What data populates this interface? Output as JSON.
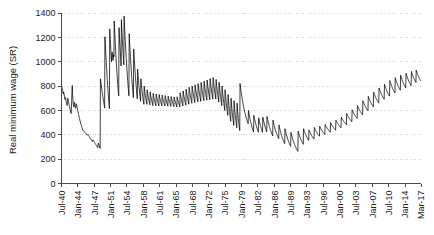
{
  "chart_data": {
    "type": "line",
    "title": "",
    "subtitle": "",
    "xlabel": "",
    "ylabel": "Real minimum wage (SR)",
    "ylim": [
      0,
      1400
    ],
    "yticks": [
      0,
      200,
      400,
      600,
      800,
      1000,
      1200,
      1400
    ],
    "ytick_labels": [
      "0",
      "200",
      "400",
      "600",
      "800",
      "1000",
      "1200",
      "1400"
    ],
    "grid": "horizontal-dotted",
    "legend": "none",
    "xtick_labels": [
      "Jul-40",
      "Jan-44",
      "Jul-47",
      "Jan-51",
      "Jul-54",
      "Jan-58",
      "Jul-61",
      "Jan-65",
      "Jul-68",
      "Jan-72",
      "Jul-75",
      "Jan-79",
      "Jul-82",
      "Jan-86",
      "Jul-89",
      "Jan-93",
      "Jul-96",
      "Jan-00",
      "Jul-03",
      "Jan-07",
      "Jul-10",
      "Jan-14",
      "Mar-17"
    ],
    "xtick_positions": [
      0,
      42,
      84,
      126,
      168,
      210,
      252,
      294,
      336,
      378,
      420,
      462,
      504,
      546,
      588,
      630,
      672,
      714,
      756,
      798,
      840,
      882,
      923
    ],
    "x_range": [
      0,
      923
    ],
    "series": [
      {
        "name": "Real minimum wage",
        "color": "#000000",
        "values": [
          800,
          795,
          783,
          770,
          762,
          745,
          735,
          752,
          742,
          728,
          712,
          700,
          690,
          706,
          697,
          682,
          668,
          655,
          648,
          640,
          672,
          700,
          690,
          676,
          665,
          652,
          640,
          630,
          618,
          607,
          596,
          586,
          575,
          612,
          680,
          760,
          805,
          742,
          690,
          660,
          640,
          628,
          646,
          668,
          655,
          640,
          628,
          618,
          635,
          655,
          648,
          636,
          624,
          612,
          600,
          590,
          578,
          566,
          556,
          545,
          535,
          524,
          514,
          505,
          496,
          487,
          478,
          470,
          462,
          454,
          446,
          438,
          440,
          437,
          433,
          430,
          427,
          424,
          420,
          417,
          414,
          411,
          408,
          405,
          402,
          399,
          396,
          400,
          404,
          400,
          396,
          392,
          388,
          384,
          380,
          376,
          372,
          368,
          364,
          360,
          356,
          352,
          348,
          344,
          352,
          358,
          354,
          350,
          346,
          342,
          338,
          334,
          330,
          326,
          322,
          318,
          314,
          310,
          306,
          302,
          298,
          294,
          320,
          332,
          324,
          316,
          308,
          300,
          292,
          288,
          860,
          840,
          820,
          800,
          782,
          764,
          748,
          730,
          714,
          698,
          682,
          666,
          650,
          634,
          620,
          1205,
          1155,
          1105,
          1055,
          1010,
          965,
          925,
          885,
          845,
          805,
          770,
          735,
          700,
          670,
          640,
          615,
          1270,
          1220,
          1170,
          1125,
          1080,
          1040,
          1000,
          1060,
          1080,
          1055,
          1030,
          1010,
          1045,
          1060,
          1040,
          1335,
          1280,
          1225,
          1175,
          1125,
          1080,
          1035,
          990,
          950,
          910,
          875,
          840,
          805,
          775,
          745,
          720,
          1280,
          1230,
          1180,
          1135,
          1090,
          1045,
          1005,
          965,
          1345,
          1290,
          1240,
          1190,
          1145,
          1100,
          1055,
          1015,
          975,
          1375,
          1320,
          1265,
          1215,
          1165,
          1120,
          1075,
          1035,
          995,
          955,
          915,
          880,
          845,
          810,
          780,
          750,
          720,
          1230,
          1180,
          1135,
          1090,
          1045,
          1005,
          965,
          925,
          890,
          855,
          820,
          790,
          760,
          730,
          705,
          1105,
          1060,
          1020,
          980,
          940,
          905,
          870,
          835,
          805,
          775,
          745,
          720,
          695,
          940,
          905,
          875,
          845,
          815,
          790,
          765,
          740,
          715,
          695,
          675,
          860,
          830,
          805,
          780,
          755,
          735,
          715,
          695,
          680,
          665,
          650,
          800,
          778,
          758,
          740,
          722,
          706,
          690,
          676,
          662,
          650,
          770,
          752,
          735,
          720,
          706,
          692,
          680,
          668,
          656,
          646,
          752,
          736,
          722,
          708,
          695,
          683,
          671,
          660,
          650,
          640,
          740,
          726,
          712,
          700,
          688,
          677,
          666,
          656,
          646,
          637,
          735,
          722,
          709,
          697,
          686,
          675,
          665,
          655,
          646,
          637,
          730,
          718,
          706,
          695,
          684,
          674,
          664,
          655,
          646,
          638,
          726,
          714,
          703,
          692,
          682,
          672,
          663,
          654,
          645,
          637,
          722,
          710,
          699,
          689,
          679,
          669,
          660,
          651,
          643,
          635,
          718,
          707,
          696,
          686,
          676,
          667,
          658,
          649,
          641,
          633,
          714,
          703,
          693,
          683,
          673,
          664,
          655,
          647,
          639,
          631,
          710,
          700,
          690,
          680,
          671,
          662,
          653,
          645,
          637,
          629,
          712,
          701,
          691,
          681,
          672,
          663,
          654,
          646,
          638,
          630,
          745,
          730,
          716,
          703,
          690,
          678,
          667,
          656,
          646,
          636,
          760,
          744,
          729,
          715,
          701,
          688,
          676,
          664,
          653,
          642,
          775,
          758,
          742,
          727,
          713,
          699,
          686,
          674,
          662,
          651,
          790,
          772,
          755,
          739,
          724,
          710,
          696,
          683,
          671,
          659,
          800,
          782,
          764,
          748,
          732,
          717,
          703,
          689,
          676,
          664,
          810,
          791,
          773,
          756,
          740,
          725,
          710,
          696,
          683,
          670,
          820,
          800,
          782,
          764,
          747,
          731,
          716,
          701,
          687,
          674,
          830,
          810,
          791,
          773,
          755,
          739,
          723,
          708,
          694,
          680,
          840,
          819,
          799,
          780,
          762,
          745,
          729,
          713,
          698,
          684,
          850,
          828,
          808,
          788,
          769,
          751,
          734,
          718,
          702,
          687,
          862,
          840,
          818,
          798,
          778,
          759,
          741,
          724,
          708,
          692,
          870,
          846,
          824,
          802,
          782,
          762,
          744,
          726,
          709,
          693,
          855,
          830,
          806,
          784,
          762,
          742,
          722,
          703,
          686,
          669,
          830,
          804,
          779,
          756,
          734,
          713,
          693,
          674,
          656,
          639,
          800,
          772,
          746,
          722,
          699,
          677,
          656,
          637,
          618,
          600,
          770,
          740,
          712,
          686,
          662,
          639,
          617,
          597,
          578,
          560,
          730,
          698,
          668,
          641,
          615,
          591,
          569,
          548,
          529,
          511,
          700,
          667,
          636,
          608,
          582,
          558,
          536,
          515,
          496,
          478,
          680,
          646,
          615,
          586,
          560,
          536,
          514,
          494,
          475,
          458,
          660,
          625,
          593,
          564,
          537,
          513,
          491,
          471,
          452,
          435,
          820,
          800,
          782,
          764,
          746,
          729,
          713,
          698,
          683,
          669,
          655,
          642,
          630,
          618,
          606,
          595,
          584,
          574,
          564,
          554,
          545,
          536,
          528,
          520,
          512,
          505,
          498,
          491,
          600,
          586,
          572,
          559,
          546,
          534,
          522,
          511,
          500,
          490,
          480,
          471,
          462,
          453,
          445,
          437,
          430,
          423,
          560,
          548,
          536,
          525,
          514,
          504,
          494,
          484,
          475,
          466,
          458,
          450,
          442,
          435,
          428,
          421,
          540,
          528,
          517,
          506,
          496,
          486,
          476,
          467,
          458,
          450,
          442,
          434,
          427,
          420,
          545,
          533,
          522,
          511,
          500,
          490,
          480,
          471,
          462,
          454,
          446,
          438,
          431,
          424,
          550,
          538,
          527,
          516,
          505,
          495,
          485,
          476,
          467,
          459,
          451,
          443,
          436,
          429,
          422,
          415,
          408,
          402,
          396,
          390,
          520,
          508,
          497,
          486,
          476,
          466,
          457,
          448,
          440,
          432,
          424,
          417,
          410,
          403,
          397,
          391,
          385,
          379,
          374,
          368,
          480,
          468,
          457,
          446,
          436,
          426,
          417,
          408,
          400,
          392,
          384,
          377,
          370,
          363,
          357,
          351,
          345,
          339,
          334,
          328,
          450,
          439,
          428,
          418,
          408,
          399,
          390,
          382,
          374,
          366,
          359,
          352,
          345,
          339,
          333,
          327,
          321,
          316,
          310,
          305,
          420,
          409,
          399,
          389,
          380,
          371,
          363,
          355,
          347,
          340,
          333,
          327,
          320,
          314,
          308,
          303,
          297,
          292,
          287,
          282,
          278,
          273,
          268,
          264,
          430,
          421,
          412,
          404,
          396,
          389,
          382,
          375,
          369,
          363,
          357,
          351,
          346,
          341,
          336,
          331,
          326,
          322,
          450,
          442,
          434,
          427,
          420,
          413,
          407,
          401,
          395,
          390,
          385,
          380,
          375,
          370,
          366,
          362,
          358,
          354,
          440,
          434,
          428,
          422,
          417,
          412,
          407,
          402,
          398,
          394,
          390,
          386,
          382,
          378,
          375,
          371,
          368,
          365,
          460,
          454,
          448,
          443,
          438,
          433,
          428,
          424,
          420,
          416,
          412,
          408,
          404,
          401,
          397,
          394,
          391,
          388,
          470,
          464,
          459,
          454,
          449,
          444,
          440,
          436,
          432,
          428,
          424,
          421,
          417,
          414,
          411,
          408,
          405,
          402,
          485,
          480,
          475,
          470,
          466,
          461,
          457,
          453,
          449,
          446,
          442,
          439,
          435,
          432,
          429,
          426,
          423,
          420,
          500,
          495,
          490,
          486,
          481,
          477,
          473,
          469,
          466,
          462,
          459,
          455,
          452,
          449,
          446,
          443,
          440,
          437,
          520,
          515,
          510,
          506,
          501,
          497,
          493,
          489,
          486,
          482,
          479,
          476,
          472,
          469,
          466,
          463,
          460,
          458,
          545,
          540,
          535,
          530,
          526,
          522,
          518,
          514,
          510,
          507,
          503,
          500,
          497,
          494,
          491,
          488,
          485,
          483,
          575,
          569,
          564,
          559,
          554,
          549,
          545,
          541,
          537,
          533,
          529,
          526,
          522,
          519,
          516,
          513,
          510,
          507,
          605,
          599,
          594,
          588,
          583,
          578,
          573,
          569,
          565,
          561,
          557,
          553,
          549,
          546,
          543,
          540,
          537,
          534,
          640,
          634,
          628,
          622,
          617,
          612,
          607,
          602,
          597,
          593,
          589,
          585,
          581,
          577,
          574,
          570,
          567,
          564,
          680,
          673,
          667,
          661,
          655,
          649,
          644,
          639,
          634,
          629,
          625,
          620,
          616,
          612,
          608,
          605,
          601,
          598,
          715,
          708,
          701,
          695,
          689,
          683,
          677,
          672,
          667,
          662,
          657,
          653,
          648,
          644,
          640,
          636,
          633,
          629,
          750,
          743,
          736,
          729,
          723,
          717,
          711,
          705,
          700,
          695,
          690,
          685,
          680,
          676,
          672,
          668,
          664,
          660,
          785,
          777,
          770,
          763,
          756,
          750,
          744,
          738,
          732,
          727,
          722,
          717,
          712,
          707,
          703,
          699,
          695,
          691,
          815,
          807,
          800,
          792,
          785,
          779,
          772,
          766,
          760,
          755,
          749,
          744,
          739,
          734,
          730,
          726,
          722,
          718,
          845,
          837,
          829,
          821,
          814,
          807,
          800,
          794,
          788,
          782,
          777,
          771,
          766,
          761,
          757,
          752,
          748,
          744,
          870,
          861,
          853,
          845,
          838,
          831,
          824,
          817,
          811,
          805,
          799,
          794,
          789,
          784,
          779,
          775,
          770,
          766,
          890,
          881,
          873,
          865,
          857,
          850,
          843,
          836,
          830,
          824,
          818,
          813,
          807,
          802,
          798,
          793,
          789,
          785,
          905,
          897,
          889,
          881,
          874,
          867,
          860,
          854,
          848,
          842,
          836,
          831,
          826,
          821,
          817,
          812,
          808,
          804,
          920,
          912,
          904,
          897,
          890,
          883,
          876,
          870,
          864,
          858,
          853,
          848,
          843,
          838,
          834,
          829,
          930,
          922,
          915,
          908,
          901,
          894,
          888,
          882,
          876,
          871,
          866,
          861,
          857,
          852,
          848,
          844,
          840
        ]
      }
    ]
  }
}
